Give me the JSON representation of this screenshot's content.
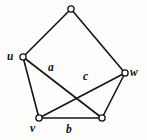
{
  "figure": {
    "type": "graph-diagram",
    "width": 147,
    "height": 140,
    "background_color": "#fdfdfc",
    "stroke_color": "#141414",
    "vertex_fill_color": "#ffffff"
  },
  "vertices": [
    {
      "id": "top",
      "label": "",
      "x": 71,
      "y": 9,
      "r": 3.1,
      "labeled": false
    },
    {
      "id": "u",
      "label": "u",
      "x": 23,
      "y": 57,
      "r": 3.1,
      "labeled": true,
      "label_x": 7,
      "label_y": 51
    },
    {
      "id": "w",
      "label": "w",
      "x": 125,
      "y": 73,
      "r": 3.1,
      "labeled": true,
      "label_x": 130,
      "label_y": 67
    },
    {
      "id": "v",
      "label": "v",
      "x": 39,
      "y": 118,
      "r": 3.1,
      "labeled": true,
      "label_x": 30,
      "label_y": 123
    },
    {
      "id": "bottomright",
      "label": "",
      "x": 102,
      "y": 118,
      "r": 3.1,
      "labeled": false
    }
  ],
  "edges": [
    {
      "id": "edge-u-top",
      "from": "u",
      "to": "top",
      "label": ""
    },
    {
      "id": "edge-top-w",
      "from": "top",
      "to": "w",
      "label": ""
    },
    {
      "id": "edge-u-v",
      "from": "u",
      "to": "v",
      "label": ""
    },
    {
      "id": "edge-w-bottomright",
      "from": "w",
      "to": "bottomright",
      "label": ""
    },
    {
      "id": "edge-v-bottomright",
      "from": "v",
      "to": "bottomright",
      "label": "b",
      "label_x": 66,
      "label_y": 124
    },
    {
      "id": "edge-u-bottomright",
      "from": "u",
      "to": "bottomright",
      "label": "a",
      "label_x": 48,
      "label_y": 62
    },
    {
      "id": "edge-v-w",
      "from": "v",
      "to": "w",
      "label": "c",
      "label_x": 83,
      "label_y": 71
    }
  ],
  "labels": {
    "vertex_u": "u",
    "vertex_v": "v",
    "vertex_w": "w",
    "edge_a": "a",
    "edge_b": "b",
    "edge_c": "c"
  }
}
